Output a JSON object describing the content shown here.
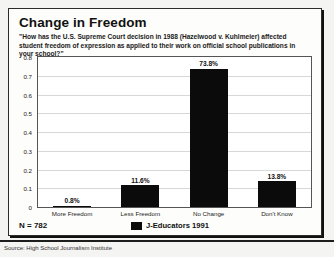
{
  "card": {
    "title": "Change in Freedom",
    "subtitle": "\"How has the U.S. Supreme Court decision in 1988 (Hazelwood v. Kuhlmeier) affected student freedom of expression as applied to their work on official school publications in your school?\"",
    "n_value": "N = 782"
  },
  "legend": {
    "swatch_color": "#0b0b0b",
    "label": "J-Educators 1991"
  },
  "footer": {
    "source": "Source: High School Journalism Institute"
  },
  "chart_data": {
    "type": "bar",
    "title": "Change in Freedom",
    "subtitle": "\"How has the U.S. Supreme Court decision in 1988 (Hazelwood v. Kuhlmeier) affected student freedom of expression as applied to their work on official school publications in your school?\"",
    "categories": [
      "More Freedom",
      "Less Freedom",
      "No Change",
      "Don't Know"
    ],
    "values": [
      0.008,
      0.116,
      0.738,
      0.138
    ],
    "data_labels": [
      "0.8%",
      "11.6%",
      "73.8%",
      "13.8%"
    ],
    "series": [
      {
        "name": "J-Educators 1991",
        "color": "#0b0b0b",
        "values": [
          0.008,
          0.116,
          0.738,
          0.138
        ]
      }
    ],
    "xlabel": "",
    "ylabel": "",
    "ylim": [
      0,
      0.8
    ],
    "ytick_labels": [
      "0.8",
      "0.7",
      "0.6",
      "0.5",
      "0.4",
      "0.3",
      "0.2",
      "0.1",
      "0"
    ],
    "ytick_values": [
      0.8,
      0.7,
      0.6,
      0.5,
      0.4,
      0.3,
      0.2,
      0.1,
      0
    ],
    "grid": true,
    "legend_position": "bottom",
    "sample_size": "N = 782",
    "source": "Source: High School Journalism Institute"
  }
}
